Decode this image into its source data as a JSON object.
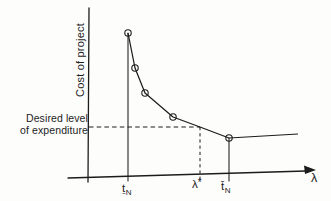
{
  "figure": {
    "y_axis_label": "Cost of project",
    "x_axis_label": "λ",
    "desired_label": {
      "line1": "Desired level",
      "line2": "of expenditure"
    },
    "ticks": {
      "lower": {
        "main": "ṯ",
        "sub": "N"
      },
      "star": {
        "main": "λ",
        "sup": "*"
      },
      "upper": {
        "main": "t̄",
        "sub": "N"
      }
    },
    "ink_color": "#1c1c1c",
    "background_color": "#fdfdfc"
  },
  "chart_data": {
    "type": "line",
    "title": "",
    "xlabel": "λ",
    "ylabel": "Cost of project",
    "x_tick_labels": [
      "ṯN",
      "λ*",
      "t̄N"
    ],
    "legend": [],
    "grid": false,
    "annotations": [
      "Dashed horizontal line at the desired level of expenditure meets the curve at λ*",
      "Dashed vertical line drops from the curve to the λ axis at λ*",
      "Solid vertical guides at ṯN (curve maximum) and t̄N (curve becomes flat)"
    ],
    "series": [
      {
        "name": "cost-vs-lambda",
        "marker": "open-circle",
        "points_px": [
          [
            128,
            33
          ],
          [
            135,
            68
          ],
          [
            145,
            93
          ],
          [
            173,
            117
          ],
          [
            200,
            127
          ],
          [
            229,
            138
          ],
          [
            298,
            134
          ]
        ],
        "marker_indices": [
          0,
          1,
          2,
          3,
          5
        ]
      }
    ],
    "layout_px": {
      "y_axis": [
        89,
        8,
        88,
        182
      ],
      "x_axis": [
        68,
        178,
        306,
        171
      ],
      "arrow_tip": [
        316,
        170
      ],
      "verticals": [
        [
          128,
          33,
          128,
          181
        ],
        [
          229,
          138,
          229,
          181
        ]
      ],
      "dashed_h": [
        89,
        127,
        200,
        127
      ],
      "dashed_v": [
        200,
        127,
        200,
        180
      ],
      "marker_radius": 3.2
    }
  }
}
